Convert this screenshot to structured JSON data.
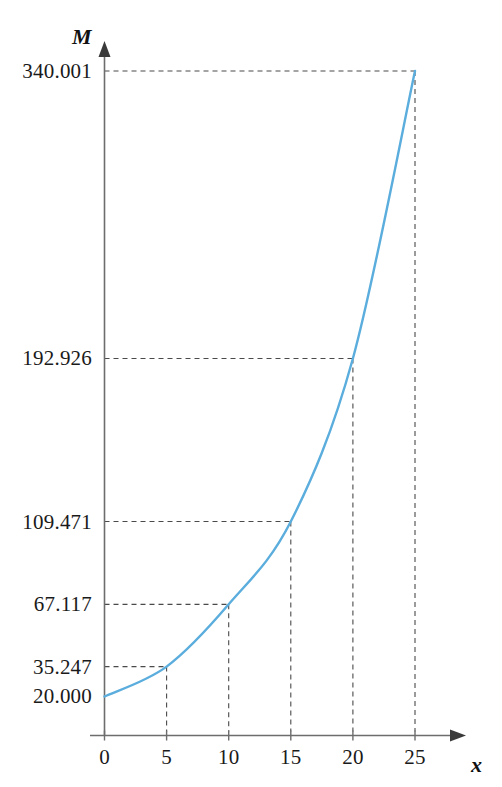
{
  "chart_data": {
    "type": "line",
    "title": "",
    "subtitle": "",
    "xlabel": "x",
    "ylabel": "M",
    "grid": "dashed-guides-to-marked-points",
    "legend": "none",
    "xlim": [
      0,
      27.5
    ],
    "ylim": [
      0,
      380
    ],
    "x": [
      0,
      5,
      10,
      15,
      20,
      25
    ],
    "values": [
      20.0,
      35.247,
      67.117,
      109.471,
      192.926,
      340.001
    ],
    "series": [
      {
        "name": "M(x)",
        "color": "#5aaddc",
        "x": [
          0,
          5,
          10,
          15,
          20,
          25
        ],
        "values": [
          20.0,
          35.247,
          67.117,
          109.471,
          192.926,
          340.001
        ]
      }
    ],
    "x_tick_labels": [
      "0",
      "5",
      "10",
      "15",
      "20",
      "25"
    ],
    "y_tick_labels": [
      "20.000",
      "35.247",
      "67.117",
      "109.471",
      "192.926",
      "340.001"
    ],
    "annotations": []
  },
  "axes": {
    "y_axis_name": "M",
    "x_axis_name": "x"
  },
  "y_ticks": [
    {
      "label": "340.001",
      "value": 340.001,
      "guide": true
    },
    {
      "label": "192.926",
      "value": 192.926,
      "guide": true
    },
    {
      "label": "109.471",
      "value": 109.471,
      "guide": true
    },
    {
      "label": "67.117",
      "value": 67.117,
      "guide": true
    },
    {
      "label": "35.247",
      "value": 35.247,
      "guide": true
    },
    {
      "label": "20.000",
      "value": 20.0,
      "guide": false
    }
  ],
  "x_ticks": [
    {
      "label": "0",
      "value": 0
    },
    {
      "label": "5",
      "value": 5
    },
    {
      "label": "10",
      "value": 10
    },
    {
      "label": "15",
      "value": 15
    },
    {
      "label": "20",
      "value": 20
    },
    {
      "label": "25",
      "value": 25
    }
  ],
  "colors": {
    "curve": "#5aaddc",
    "axis": "#6d6d6d",
    "guide": "#4a4a4a",
    "text": "#1a1a1a",
    "background": "#ffffff"
  }
}
